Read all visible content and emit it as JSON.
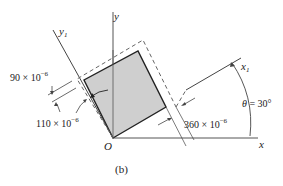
{
  "figure": {
    "caption": "(b)",
    "axes": {
      "x_label": "x",
      "y_label": "y",
      "x1_label": "x",
      "x1_sub": "1",
      "y1_label": "y",
      "y1_sub": "1",
      "origin_label": "O"
    },
    "angle": {
      "symbol": "θ",
      "text": " = 30°"
    },
    "strains": [
      {
        "name": "normal-strain-y1",
        "base": "90 × 10",
        "exp": "−6"
      },
      {
        "name": "shear-strain",
        "base": "110 × 10",
        "exp": "−6"
      },
      {
        "name": "normal-strain-x1",
        "base": "360 × 10",
        "exp": "−6"
      }
    ],
    "colors": {
      "element_fill": "#cfcfcf",
      "line": "#333333",
      "dashed": "#666666"
    }
  }
}
